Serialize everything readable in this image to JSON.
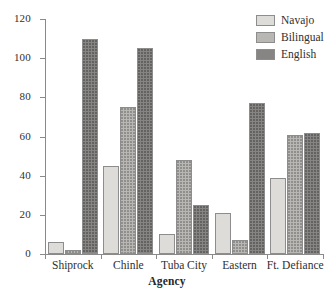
{
  "chart_data": {
    "type": "bar",
    "title": "",
    "xlabel": "Agency",
    "ylabel": "",
    "ylim": [
      0,
      120
    ],
    "yticks": [
      0,
      20,
      40,
      60,
      80,
      100,
      120
    ],
    "ytick_labels": [
      "0",
      "20",
      "40",
      "60",
      "80",
      "100",
      "120"
    ],
    "grid": false,
    "legend_position": "top-right",
    "categories": [
      "Shiprock",
      "Chinle",
      "Tuba City",
      "Eastern",
      "Ft. Defiance"
    ],
    "series": [
      {
        "name": "Navajo",
        "color": "#dedcd8",
        "values": [
          6,
          45,
          10,
          21,
          39
        ]
      },
      {
        "name": "Bilingual",
        "color": "#b9b7b3",
        "values": [
          2,
          75,
          48,
          7,
          61
        ]
      },
      {
        "name": "English",
        "color": "#878583",
        "values": [
          110,
          105,
          25,
          77,
          62
        ]
      }
    ]
  },
  "legend": {
    "items": [
      {
        "label": "Navajo"
      },
      {
        "label": "Bilingual"
      },
      {
        "label": "English"
      }
    ]
  },
  "axes": {
    "x_title": "Agency"
  }
}
